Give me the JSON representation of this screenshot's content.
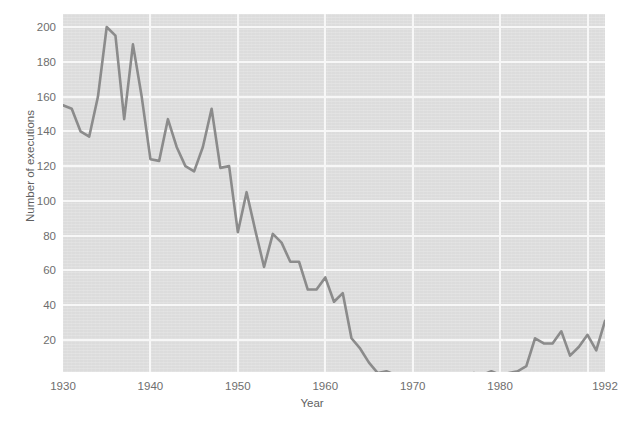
{
  "chart_data": {
    "type": "line",
    "title": "",
    "xlabel": "Year",
    "ylabel": "Number of executions",
    "xlim": [
      1930,
      1992
    ],
    "ylim": [
      0,
      208
    ],
    "grid": true,
    "legend": "none",
    "xticks": [
      1930,
      1940,
      1950,
      1960,
      1970,
      1980,
      1992
    ],
    "yticks": [
      20,
      40,
      60,
      80,
      100,
      120,
      140,
      160,
      180,
      200
    ],
    "series": [
      {
        "name": "Number of executions",
        "color": "#8b8b8b",
        "x": [
          1930,
          1931,
          1932,
          1933,
          1934,
          1935,
          1936,
          1937,
          1938,
          1939,
          1940,
          1941,
          1942,
          1943,
          1944,
          1945,
          1946,
          1947,
          1948,
          1949,
          1950,
          1951,
          1952,
          1953,
          1954,
          1955,
          1956,
          1957,
          1958,
          1959,
          1960,
          1961,
          1962,
          1963,
          1964,
          1965,
          1966,
          1967,
          1968,
          1969,
          1970,
          1971,
          1972,
          1973,
          1974,
          1975,
          1976,
          1977,
          1978,
          1979,
          1980,
          1981,
          1982,
          1983,
          1984,
          1985,
          1986,
          1987,
          1988,
          1989,
          1990,
          1991,
          1992
        ],
        "y": [
          155,
          153,
          140,
          137,
          160,
          200,
          195,
          147,
          190,
          160,
          124,
          123,
          147,
          131,
          120,
          117,
          131,
          153,
          119,
          120,
          82,
          105,
          83,
          62,
          81,
          76,
          65,
          65,
          49,
          49,
          56,
          42,
          47,
          21,
          15,
          7,
          1,
          2,
          0,
          0,
          0,
          0,
          0,
          0,
          0,
          0,
          0,
          1,
          0,
          2,
          0,
          1,
          2,
          5,
          21,
          18,
          18,
          25,
          11,
          16,
          23,
          14,
          31
        ]
      }
    ]
  },
  "axes": {
    "y_tick_labels": [
      "200",
      "180",
      "160",
      "140",
      "120",
      "100",
      "80",
      "60",
      "40",
      "20"
    ],
    "x_tick_labels": [
      "1930",
      "1940",
      "1950",
      "1960",
      "1970",
      "1980",
      "1992"
    ],
    "x_axis_title": "Year",
    "y_axis_title": "Number of executions"
  },
  "style": {
    "panel_background": "#dcdcdc",
    "gridline_color": "#f7f7f7",
    "line_color": "#8b8b8b",
    "tick_text_color": "#6e6e6e",
    "figure_background": "#ffffff"
  }
}
